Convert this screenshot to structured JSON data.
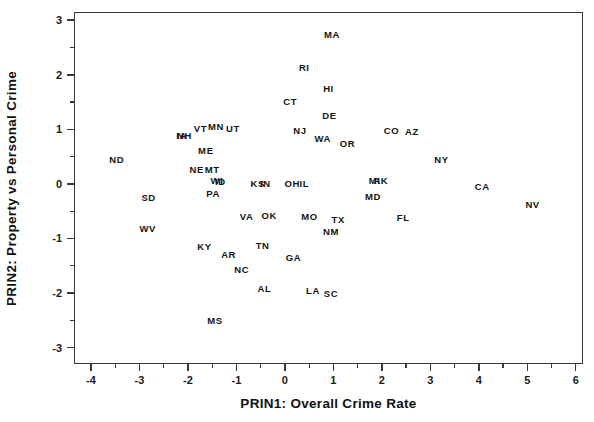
{
  "chart_data": {
    "type": "scatter",
    "title": "",
    "xlabel": "PRIN1: Overall Crime Rate",
    "ylabel": "PRIN2: Property vs Personal Crime",
    "xlim": [
      -4.35,
      6.15
    ],
    "ylim": [
      -3.3,
      3.15
    ],
    "grid": false,
    "legend": null,
    "marker_style": "text-label",
    "xticks": [
      -4,
      -3,
      -2,
      -1,
      0,
      1,
      2,
      3,
      4,
      5,
      6
    ],
    "xticklabels": [
      "-4",
      "-3",
      "-2",
      "-1",
      "0",
      "1",
      "2",
      "3",
      "4",
      "5",
      "6"
    ],
    "yticks": [
      -3,
      -2,
      -1,
      0,
      1,
      2,
      3
    ],
    "yticklabels": [
      "-3",
      "-2",
      "-1",
      "0",
      "1",
      "2",
      "3"
    ],
    "xminorticks": [
      -3.5,
      -2.5,
      -1.5,
      -0.5,
      0.5,
      1.5,
      2.5,
      3.5,
      4.5,
      5.5
    ],
    "yminorticks": [
      -2.5,
      -1.5,
      -0.5,
      0.5,
      1.5,
      2.5
    ],
    "points": [
      {
        "label": "MA",
        "x": 0.97,
        "y": 2.72
      },
      {
        "label": "RI",
        "x": 0.4,
        "y": 2.13
      },
      {
        "label": "HI",
        "x": 0.9,
        "y": 1.73
      },
      {
        "label": "CT",
        "x": 0.11,
        "y": 1.5
      },
      {
        "label": "DE",
        "x": 0.92,
        "y": 1.24
      },
      {
        "label": "MN",
        "x": -1.42,
        "y": 1.05
      },
      {
        "label": "VT",
        "x": -1.74,
        "y": 1.0
      },
      {
        "label": "UT",
        "x": -1.07,
        "y": 1.0
      },
      {
        "label": "NJ",
        "x": 0.31,
        "y": 0.97
      },
      {
        "label": "CO",
        "x": 2.2,
        "y": 0.97
      },
      {
        "label": "AZ",
        "x": 2.62,
        "y": 0.96
      },
      {
        "label": "NH",
        "x": -2.07,
        "y": 0.88
      },
      {
        "label": "IA",
        "x": -2.13,
        "y": 0.88
      },
      {
        "label": "WA",
        "x": 0.78,
        "y": 0.83
      },
      {
        "label": "OR",
        "x": 1.29,
        "y": 0.73
      },
      {
        "label": "ME",
        "x": -1.63,
        "y": 0.6
      },
      {
        "label": "ND",
        "x": -3.47,
        "y": 0.44
      },
      {
        "label": "NY",
        "x": 3.23,
        "y": 0.43
      },
      {
        "label": "MT",
        "x": -1.5,
        "y": 0.26
      },
      {
        "label": "NE",
        "x": -1.82,
        "y": 0.25
      },
      {
        "label": "WI",
        "x": -1.4,
        "y": 0.05
      },
      {
        "label": "ID",
        "x": -1.33,
        "y": 0.03
      },
      {
        "label": "MI",
        "x": 1.85,
        "y": 0.05
      },
      {
        "label": "AK",
        "x": 1.98,
        "y": 0.05
      },
      {
        "label": "OH",
        "x": 0.15,
        "y": 0.0
      },
      {
        "label": "IL",
        "x": 0.4,
        "y": 0.0
      },
      {
        "label": "KS",
        "x": -0.56,
        "y": 0.0
      },
      {
        "label": "IN",
        "x": -0.4,
        "y": 0.0
      },
      {
        "label": "CA",
        "x": 4.07,
        "y": -0.05
      },
      {
        "label": "PA",
        "x": -1.48,
        "y": -0.19
      },
      {
        "label": "SD",
        "x": -2.81,
        "y": -0.25
      },
      {
        "label": "MD",
        "x": 1.82,
        "y": -0.24
      },
      {
        "label": "NV",
        "x": 5.11,
        "y": -0.38
      },
      {
        "label": "VA",
        "x": -0.79,
        "y": -0.61
      },
      {
        "label": "OK",
        "x": -0.32,
        "y": -0.58
      },
      {
        "label": "MO",
        "x": 0.51,
        "y": -0.6
      },
      {
        "label": "TX",
        "x": 1.1,
        "y": -0.66
      },
      {
        "label": "FL",
        "x": 2.44,
        "y": -0.62
      },
      {
        "label": "WV",
        "x": -2.83,
        "y": -0.83
      },
      {
        "label": "NM",
        "x": 0.95,
        "y": -0.88
      },
      {
        "label": "TN",
        "x": -0.46,
        "y": -1.13
      },
      {
        "label": "KY",
        "x": -1.66,
        "y": -1.16
      },
      {
        "label": "AR",
        "x": -1.16,
        "y": -1.31
      },
      {
        "label": "GA",
        "x": 0.18,
        "y": -1.36
      },
      {
        "label": "NC",
        "x": -0.89,
        "y": -1.58
      },
      {
        "label": "AL",
        "x": -0.42,
        "y": -1.93
      },
      {
        "label": "LA",
        "x": 0.58,
        "y": -1.97
      },
      {
        "label": "SC",
        "x": 0.95,
        "y": -2.02
      },
      {
        "label": "MS",
        "x": -1.44,
        "y": -2.51
      }
    ]
  }
}
